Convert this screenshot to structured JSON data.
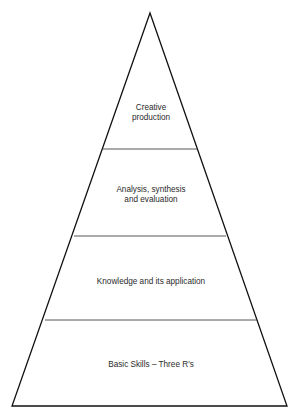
{
  "diagram": {
    "type": "pyramid",
    "apex": {
      "x": 150,
      "y": 13
    },
    "base": {
      "y": 406,
      "left_x": 12,
      "right_x": 287
    },
    "dividers": [
      {
        "y": 149,
        "left_x": 103,
        "right_x": 197
      },
      {
        "y": 236,
        "left_x": 74,
        "right_x": 226
      },
      {
        "y": 320,
        "left_x": 45,
        "right_x": 257
      }
    ],
    "levels": [
      {
        "name": "top",
        "lines": [
          "Creative",
          "production"
        ]
      },
      {
        "name": "second",
        "lines": [
          "Analysis, synthesis",
          "and evaluation"
        ]
      },
      {
        "name": "third",
        "lines": [
          "Knowledge and its application"
        ]
      },
      {
        "name": "base",
        "lines": [
          "Basic Skills – Three R's"
        ]
      }
    ]
  }
}
